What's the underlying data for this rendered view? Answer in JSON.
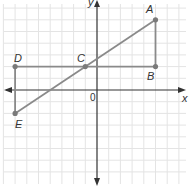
{
  "diagram": {
    "type": "coordinate-plane",
    "axes": {
      "x_label": "x",
      "y_label": "y",
      "origin_label": "0"
    },
    "grid": {
      "x_min": -8,
      "x_max": 7,
      "y_min": -7,
      "y_max": 7
    },
    "points": [
      {
        "name": "A",
        "x": 5,
        "y": 6
      },
      {
        "name": "B",
        "x": 5,
        "y": 2
      },
      {
        "name": "C",
        "x": -1,
        "y": 2
      },
      {
        "name": "D",
        "x": -7,
        "y": 2
      },
      {
        "name": "E",
        "x": -7,
        "y": -2
      }
    ],
    "segments": [
      [
        "D",
        "B"
      ],
      [
        "A",
        "B"
      ],
      [
        "D",
        "E"
      ],
      [
        "E",
        "A"
      ]
    ],
    "colors": {
      "grid": "#e4e4e4",
      "axis": "#333333",
      "figure": "#8a8a8a",
      "point": "#7a7a7a"
    }
  }
}
